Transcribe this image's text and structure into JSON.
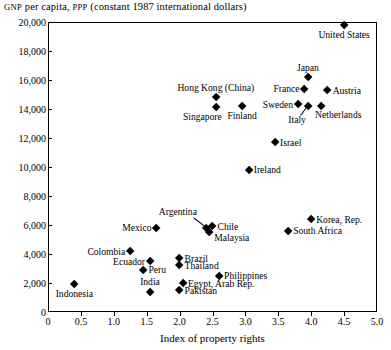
{
  "chart_data": {
    "type": "scatter",
    "title": "GNP per capita, PPP (constant 1987 international dollars)",
    "title_smallcaps": [
      "GNP",
      "PPP"
    ],
    "xlabel": "Index of property rights",
    "ylabel": "",
    "xlim": [
      0,
      5.0
    ],
    "ylim": [
      0,
      20000
    ],
    "xticks": [
      "0",
      "0.5",
      "1.0",
      "1.5",
      "2.0",
      "2.5",
      "3.0",
      "3.5",
      "4.0",
      "4.5",
      "5.0"
    ],
    "xtick_values": [
      0,
      0.5,
      1.0,
      1.5,
      2.0,
      2.5,
      3.0,
      3.5,
      4.0,
      4.5,
      5.0
    ],
    "yticks": [
      "0",
      "2,000",
      "4,000",
      "6,000",
      "8,000",
      "10,000",
      "12,000",
      "14,000",
      "16,000",
      "18,000",
      "20,000"
    ],
    "ytick_values": [
      0,
      2000,
      4000,
      6000,
      8000,
      10000,
      12000,
      14000,
      16000,
      18000,
      20000
    ],
    "grid": false,
    "legend": false,
    "marker": "diamond",
    "marker_color": "#000000",
    "points": [
      {
        "label": "United States",
        "x": 4.5,
        "y": 19800,
        "label_pos": "below"
      },
      {
        "label": "Japan",
        "x": 3.95,
        "y": 16200,
        "label_pos": "above"
      },
      {
        "label": "France",
        "x": 3.9,
        "y": 15400,
        "label_pos": "left"
      },
      {
        "label": "Austria",
        "x": 4.25,
        "y": 15300,
        "label_pos": "right"
      },
      {
        "label": "Sweden",
        "x": 3.8,
        "y": 14300,
        "label_pos": "left"
      },
      {
        "label": "Italy",
        "x": 3.95,
        "y": 14200,
        "label_pos": "leader-below-left"
      },
      {
        "label": "Netherlands",
        "x": 4.15,
        "y": 14200,
        "label_pos": "below-right"
      },
      {
        "label": "Hong Kong (China)",
        "x": 2.55,
        "y": 14800,
        "label_pos": "above"
      },
      {
        "label": "Singapore",
        "x": 2.55,
        "y": 14100,
        "label_pos": "below-left"
      },
      {
        "label": "Finland",
        "x": 2.95,
        "y": 14200,
        "label_pos": "below"
      },
      {
        "label": "Israel",
        "x": 3.45,
        "y": 11700,
        "label_pos": "right"
      },
      {
        "label": "Ireland",
        "x": 3.05,
        "y": 9800,
        "label_pos": "right"
      },
      {
        "label": "Korea, Rep.",
        "x": 4.0,
        "y": 6400,
        "label_pos": "right"
      },
      {
        "label": "South Africa",
        "x": 3.65,
        "y": 5600,
        "label_pos": "right"
      },
      {
        "label": "Chile",
        "x": 2.5,
        "y": 5900,
        "label_pos": "right"
      },
      {
        "label": "Argentina",
        "x": 2.4,
        "y": 5800,
        "label_pos": "leader-above-left"
      },
      {
        "label": "Malaysia",
        "x": 2.45,
        "y": 5500,
        "label_pos": "right-below"
      },
      {
        "label": "Mexico",
        "x": 1.65,
        "y": 5800,
        "label_pos": "left"
      },
      {
        "label": "Colombia",
        "x": 1.25,
        "y": 4200,
        "label_pos": "left"
      },
      {
        "label": "Brazil",
        "x": 2.0,
        "y": 3700,
        "label_pos": "right"
      },
      {
        "label": "Ecuador",
        "x": 1.55,
        "y": 3500,
        "label_pos": "left"
      },
      {
        "label": "Thailand",
        "x": 2.0,
        "y": 3200,
        "label_pos": "right"
      },
      {
        "label": "Peru",
        "x": 1.45,
        "y": 2900,
        "label_pos": "right"
      },
      {
        "label": "Philippines",
        "x": 2.6,
        "y": 2500,
        "label_pos": "right"
      },
      {
        "label": "Egypt, Arab Rep.",
        "x": 2.05,
        "y": 2000,
        "label_pos": "right"
      },
      {
        "label": "Indonesia",
        "x": 0.4,
        "y": 1900,
        "label_pos": "below"
      },
      {
        "label": "Pakistan",
        "x": 2.0,
        "y": 1500,
        "label_pos": "right"
      },
      {
        "label": "India",
        "x": 1.55,
        "y": 1400,
        "label_pos": "above"
      }
    ]
  }
}
